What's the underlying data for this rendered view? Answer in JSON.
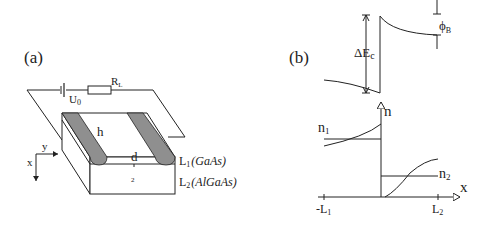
{
  "panel_a": {
    "label": "(a)",
    "source_label": "U",
    "source_sub": "0",
    "resistor_label": "R",
    "resistor_sub": "L",
    "strip_label": "h",
    "gap_label": "d",
    "axis_y": "y",
    "axis_x": "x",
    "region_label": "2",
    "layer1_main": "L",
    "layer1_sub": "1",
    "layer1_material": "(GaAs)",
    "layer2_main": "L",
    "layer2_sub": "2",
    "layer2_material": "(AlGaAs)"
  },
  "panel_b": {
    "label": "(b)",
    "delta_ec": "ΔE",
    "delta_ec_sub": "c",
    "phi": "ϕ",
    "phi_sub": "B",
    "n_axis": "n",
    "n1": "n",
    "n1_sub": "1",
    "n2": "n",
    "n2_sub": "2",
    "x_axis": "x",
    "tick_left": "-L",
    "tick_left_sub": "1",
    "tick_right": "L",
    "tick_right_sub": "2"
  },
  "colors": {
    "line": "#222222",
    "strip_fill": "#8f8f8f",
    "background": "#ffffff"
  }
}
